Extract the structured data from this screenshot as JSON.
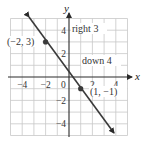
{
  "diagram": {
    "type": "coordinate-plane-line",
    "axes": {
      "x_label": "x",
      "y_label": "y",
      "x_range": [
        -5,
        5
      ],
      "y_range": [
        -5,
        5
      ],
      "grid": true,
      "grid_step": 1
    },
    "x_ticks": [
      {
        "value": -4,
        "label": "−4"
      },
      {
        "value": -2,
        "label": "−2"
      },
      {
        "value": 0,
        "label": "0"
      },
      {
        "value": 2,
        "label": "2"
      },
      {
        "value": 4,
        "label": "4"
      }
    ],
    "y_ticks": [
      {
        "value": 4,
        "label": "4"
      },
      {
        "value": 2,
        "label": "2"
      },
      {
        "value": -2,
        "label": "−2"
      },
      {
        "value": -4,
        "label": "−4"
      }
    ],
    "points": [
      {
        "x": -2,
        "y": 3,
        "label": "(−2, 3)"
      },
      {
        "x": 1,
        "y": -1,
        "label": "(1, −1)"
      }
    ],
    "annotations": {
      "run": "right 3",
      "rise": "down 4"
    },
    "line": {
      "slope": "-4/3",
      "through": [
        [
          -2,
          3
        ],
        [
          1,
          -1
        ]
      ],
      "color": "#3a3a3a",
      "arrows": "both"
    }
  }
}
